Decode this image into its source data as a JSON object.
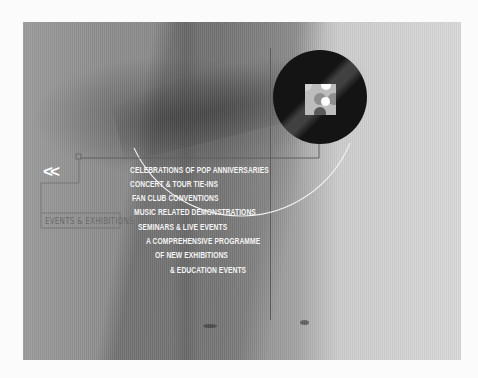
{
  "nav": {
    "back_label": "<<",
    "section_label": "EVENTS & EXHIBITIONS"
  },
  "event_list": {
    "items": [
      {
        "label": "CELEBRATIONS OF POP ANNIVERSARIES",
        "x": 130,
        "y": 165
      },
      {
        "label": "CONCERT & TOUR TIE-INS",
        "x": 130,
        "y": 179
      },
      {
        "label": "FAN CLUB CONVENTIONS",
        "x": 132,
        "y": 193
      },
      {
        "label": "MUSIC RELATED DEMONSTRATIONS",
        "x": 134,
        "y": 207
      },
      {
        "label": "SEMINARS & LIVE EVENTS",
        "x": 138,
        "y": 222
      },
      {
        "label": "A COMPREHENSIVE PROGRAMME",
        "x": 146,
        "y": 236
      },
      {
        "label": "OF NEW EXHIBITIONS",
        "x": 155,
        "y": 250
      },
      {
        "label": "& EDUCATION EVENTS",
        "x": 170,
        "y": 265
      }
    ]
  },
  "disc": {
    "icon": "vinyl-record-icon",
    "label_colors": [
      "#bdbdbd",
      "#8f8f8f",
      "#ffffff",
      "#5a5a5a"
    ]
  },
  "colors": {
    "text_primary": "#f4f4f4",
    "text_secondary": "#6a6a6a",
    "line": "#5e5e5e",
    "arc": "#f0f0f0",
    "disc": "#141414",
    "page_bg": "#fbfbfb"
  }
}
